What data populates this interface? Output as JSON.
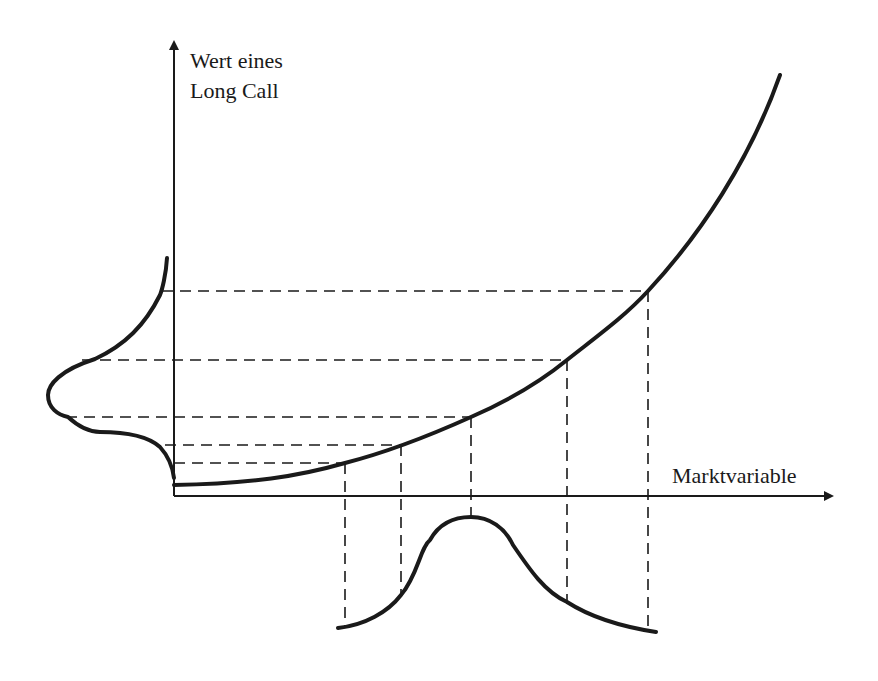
{
  "diagram": {
    "y_axis_label_line1": "Wert eines",
    "y_axis_label_line2": "Long Call",
    "x_axis_label": "Marktvariable",
    "colors": {
      "stroke": "#1a1a1a",
      "background": "#ffffff"
    }
  }
}
